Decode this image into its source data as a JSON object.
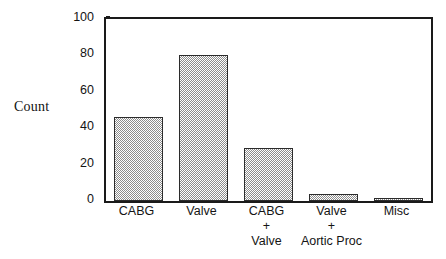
{
  "chart_data": {
    "type": "bar",
    "title": "",
    "xlabel": "",
    "ylabel": "Count",
    "categories": [
      "CABG",
      "Valve",
      "CABG\n+\nValve",
      "Valve\n+\nAortic Proc",
      "Misc"
    ],
    "values": [
      46,
      80,
      29,
      4,
      1
    ],
    "ylim": [
      0,
      100
    ],
    "yticks": [
      "0",
      "20",
      "40",
      "60",
      "80",
      "100"
    ],
    "ytick_values": [
      0,
      20,
      40,
      60,
      80,
      100
    ],
    "grid": false,
    "legend": "none",
    "bar_fill_color": "#8d8d8d",
    "bar_edge_color": "#2b2b2b",
    "axis_color": "#1a1a1a",
    "background_color": "#ffffff"
  }
}
